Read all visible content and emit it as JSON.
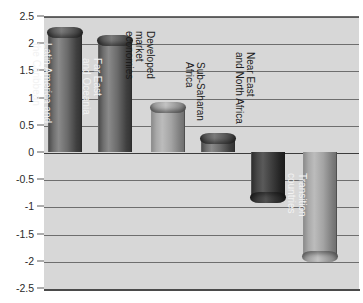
{
  "chart_data": {
    "type": "bar",
    "title": "",
    "subtitle": "",
    "xlabel": "",
    "ylabel": "",
    "ylim": [
      -2.5,
      2.5
    ],
    "grid": true,
    "legend_position": "none",
    "orientation": "vertical",
    "categories": [
      "Latin America and the Caribbean",
      "Far East and Oceania",
      "Developed market economies",
      "Sub-Saharan Africa",
      "Near East and North Africa",
      "Transition countries"
    ],
    "values": [
      2.2,
      2.05,
      0.83,
      0.26,
      -0.85,
      -1.93
    ],
    "ytick_labels": [
      "2.5",
      "2",
      "1.5",
      "1",
      "0.5",
      "0",
      "-0.5",
      "-1",
      "-1.5",
      "-2",
      "-2.5"
    ],
    "ytick_values": [
      2.5,
      2,
      1.5,
      1,
      0.5,
      0,
      -0.5,
      -1,
      -1.5,
      -2,
      -2.5
    ],
    "annotations": []
  },
  "axis": {
    "ticks": [
      {
        "label": "2.5",
        "value": 2.5
      },
      {
        "label": "2",
        "value": 2
      },
      {
        "label": "1.5",
        "value": 1.5
      },
      {
        "label": "1",
        "value": 1
      },
      {
        "label": "0.5",
        "value": 0.5
      },
      {
        "label": "0",
        "value": 0
      },
      {
        "label": "-0.5",
        "value": -0.5
      },
      {
        "label": "-1",
        "value": -1
      },
      {
        "label": "-1.5",
        "value": -1.5
      },
      {
        "label": "-2",
        "value": -2
      },
      {
        "label": "-2.5",
        "value": -2.5
      }
    ]
  },
  "bars": [
    {
      "label": "Latin America and\nthe Caribbean",
      "value": 2.2,
      "shade": "dark",
      "label_placement": "inside"
    },
    {
      "label": "Far East\nand Oceania",
      "value": 2.05,
      "shade": "dark",
      "label_placement": "inside"
    },
    {
      "label": "Developed\nmarket\neconomies",
      "value": 0.83,
      "shade": "light",
      "label_placement": "outside"
    },
    {
      "label": "Sub-Saharan\nAfrica",
      "value": 0.26,
      "shade": "dark",
      "label_placement": "outside"
    },
    {
      "label": "Near East\nand North Africa",
      "value": -0.85,
      "shade": "verydark",
      "label_placement": "outside"
    },
    {
      "label": "Transition\ncountries",
      "value": -1.93,
      "shade": "light",
      "label_placement": "inside"
    }
  ],
  "colors": {
    "plot_background": "#d7d7d7",
    "page_background": "#ffffff",
    "gridline": "#6e6e6e",
    "zero_line": "#3c3c3c",
    "tick_text": "#2a2a2a",
    "label_inside": "#f2f2f2",
    "label_outside": "#1c1c1c",
    "bar_dark": "#6a6a6a",
    "bar_light": "#a9a9a9",
    "bar_verydark": "#333333"
  }
}
